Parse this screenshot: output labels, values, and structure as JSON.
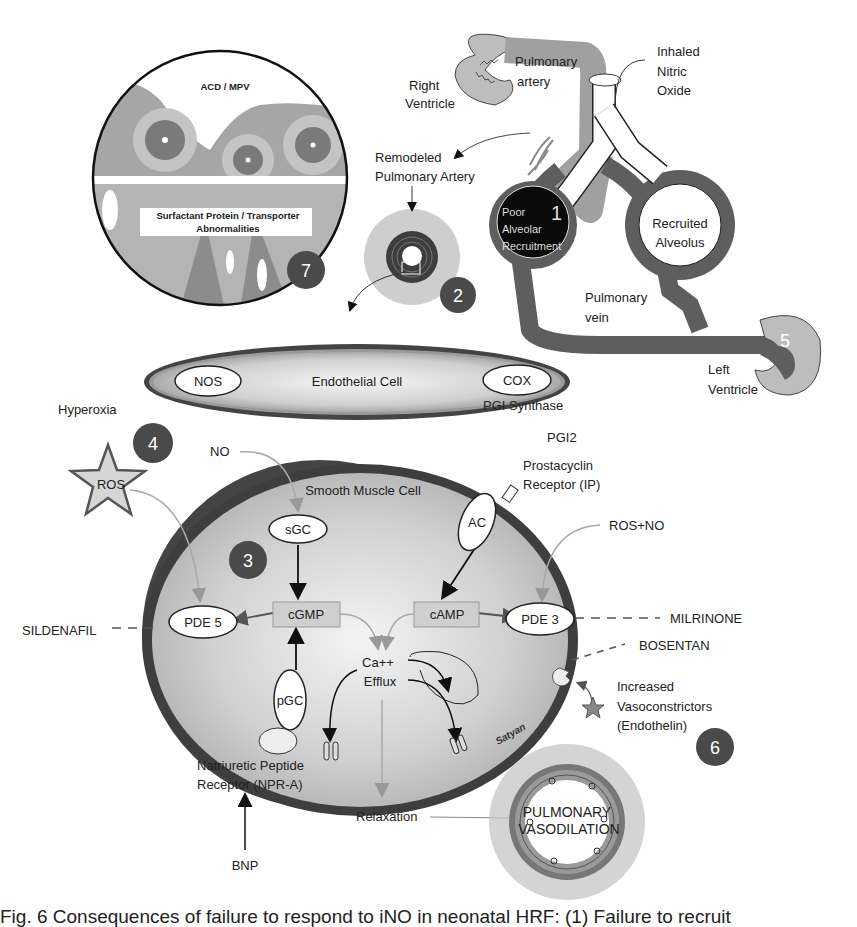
{
  "colors": {
    "dark_badge": "#4a4a4a",
    "vessel_dark": "#5a5a5a",
    "vessel_light": "#b8b8b8",
    "cell_fill": "#c8c8c8",
    "membrane": "#3c3c3c",
    "light_arrow": "#a8a8a8",
    "black": "#111111"
  },
  "inset_circle": {
    "top_label": "ACD / MPV",
    "bottom_label_line1": "Surfactant Protein / Transporter",
    "bottom_label_line2": "Abnormalities",
    "badge": "7"
  },
  "lung": {
    "right_ventricle_line1": "Right",
    "right_ventricle_line2": "Ventricle",
    "pulmonary_artery_line1": "Pulmonary",
    "pulmonary_artery_line2": "artery",
    "inhaled_line1": "Inhaled",
    "inhaled_line2": "Nitric",
    "inhaled_line3": "Oxide",
    "remodeled_line1": "Remodeled",
    "remodeled_line2": "Pulmonary Artery",
    "poor_line1": "Poor",
    "poor_line2": "Alveolar",
    "poor_line3": "Recruitment",
    "badge1": "1",
    "recruited_line1": "Recruited",
    "recruited_line2": "Alveolus",
    "vein_line1": "Pulmonary",
    "vein_line2": "vein",
    "left_ventricle_line1": "Left",
    "left_ventricle_line2": "Ventricle",
    "badge5": "5",
    "badge2": "2"
  },
  "endothelial": {
    "title": "Endothelial Cell",
    "nos": "NOS",
    "cox": "COX",
    "pgi_synthase": "PGI Synthase",
    "pgi2": "PGI2"
  },
  "left_side": {
    "hyperoxia": "Hyperoxia",
    "badge4": "4",
    "ros": "ROS",
    "no": "NO",
    "sildenafil": "SILDENAFIL"
  },
  "smooth_muscle": {
    "title": "Smooth Muscle Cell",
    "badge3": "3",
    "sgc": "sGC",
    "ac": "AC",
    "cgmp": "cGMP",
    "camp": "cAMP",
    "pde5": "PDE 5",
    "pde3": "PDE 3",
    "ca_line1": "Ca++",
    "ca_line2": "Efflux",
    "pgc": "pGC",
    "signature": "Satyan"
  },
  "right_side": {
    "prostacyclin_line1": "Prostacyclin",
    "prostacyclin_line2": "Receptor (IP)",
    "ros_no": "ROS+NO",
    "milrinone": "MILRINONE",
    "bosentan": "BOSENTAN",
    "increased_line1": "Increased",
    "increased_line2": "Vasoconstrictors",
    "increased_line3": "(Endothelin)",
    "et1": "ET-1",
    "badge6": "6"
  },
  "bottom": {
    "npr_line1": "Natriuretic Peptide",
    "npr_line2": "Receptor (NPR-A)",
    "bnp": "BNP",
    "relaxation": "Relaxation",
    "vaso_line1": "PULMONARY",
    "vaso_line2": "VASODILATION"
  },
  "caption": {
    "text": "Fig. 6  Consequences of failure to respond to iNO in neonatal HRF: (1) Failure to recruit"
  }
}
